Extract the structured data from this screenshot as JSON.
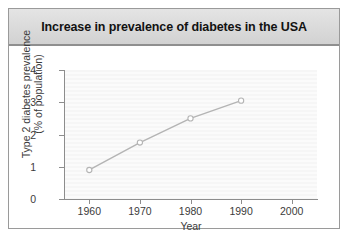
{
  "figure": {
    "title": "Increase in prevalence of diabetes in the USA"
  },
  "chart_data": {
    "type": "line",
    "title": "Increase in prevalence of diabetes in the USA",
    "xlabel": "Year",
    "ylabel": "Type 2 diabetes prevalence (% of population)",
    "ylabel_line1": "Type 2 diabetes prevalence",
    "ylabel_line2": "(% of population)",
    "x": [
      1960,
      1970,
      1980,
      1990
    ],
    "values": [
      0.9,
      1.75,
      2.5,
      3.05
    ],
    "points": [
      {
        "x": 1960,
        "y": 0.9
      },
      {
        "x": 1970,
        "y": 1.75
      },
      {
        "x": 1980,
        "y": 2.5
      },
      {
        "x": 1990,
        "y": 3.05
      }
    ],
    "xlim": [
      1955,
      2005
    ],
    "ylim": [
      0,
      4
    ],
    "xticks": [
      1960,
      1970,
      1980,
      1990,
      2000
    ],
    "xtick_labels": [
      "1960",
      "1970",
      "1980",
      "1990",
      "2000"
    ],
    "yticks": [
      0,
      1,
      2,
      3,
      4
    ],
    "ytick_labels": [
      "0",
      "1",
      "2",
      "3",
      "4"
    ],
    "grid": false,
    "legend": null,
    "marker": "open-circle",
    "line_color": "#b4b4b4",
    "marker_color": "#b4b4b4",
    "plot_background": "#f7f7f7",
    "axis_color": "#8d8d8d",
    "title_bar_color": "#dcdcdc",
    "frame_border_color": "#9a9a9a"
  }
}
